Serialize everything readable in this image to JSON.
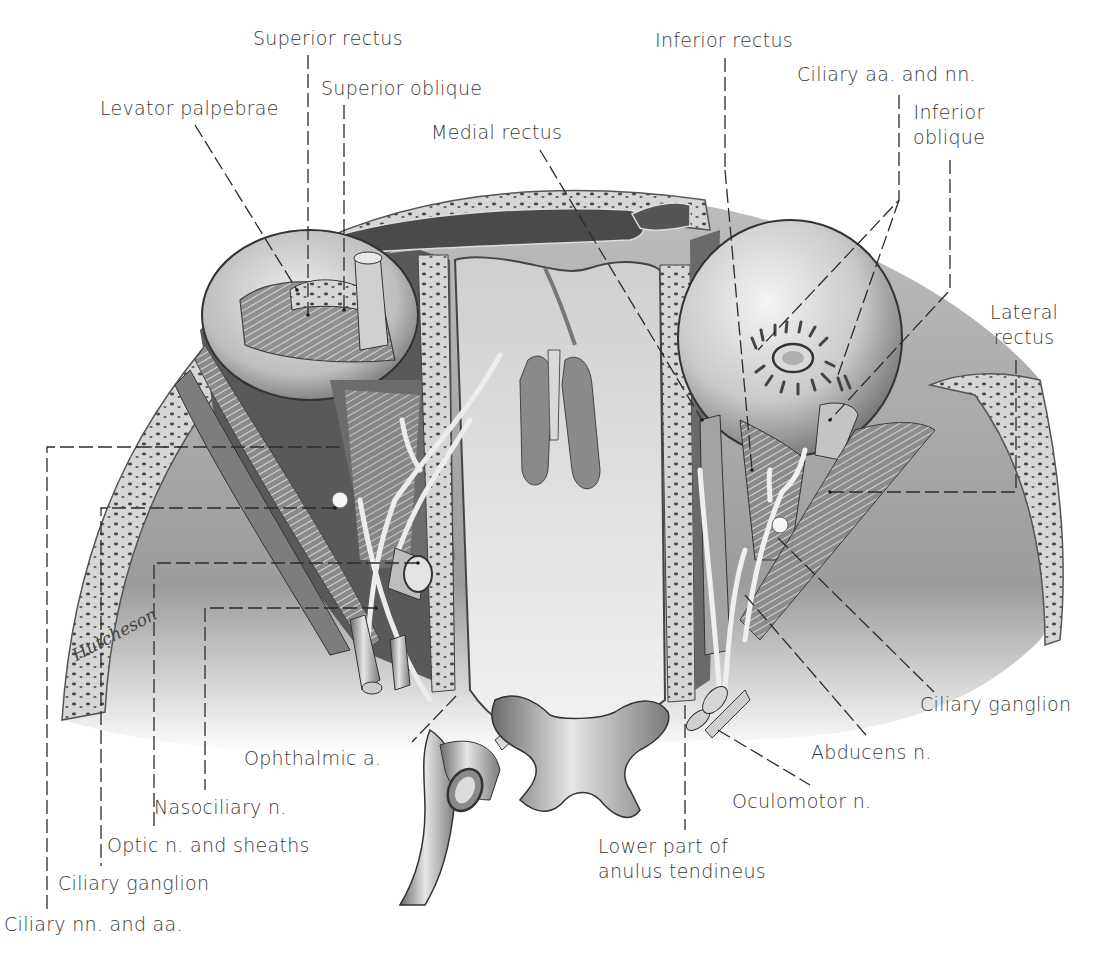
{
  "figure": {
    "signature": "Hutcheson",
    "colors": {
      "background": "#ffffff",
      "label_text": "#3a3a3a",
      "leader_line": "#2b2b2b",
      "bone_light": "#d9d9d9",
      "bone_dark": "#5a5a5a",
      "tissue_mid": "#9a9a9a",
      "tissue_dark": "#3c3c3c"
    }
  },
  "labels": {
    "superior_rectus": "Superior rectus",
    "superior_oblique": "Superior oblique",
    "levator_palpebrae": "Levator palpebrae",
    "medial_rectus": "Medial rectus",
    "inferior_rectus": "Inferior rectus",
    "ciliary_aa_nn": "Ciliary aa. and nn.",
    "inferior_oblique_1": "Inferior",
    "inferior_oblique_2": "oblique",
    "lateral_rectus_1": "Lateral",
    "lateral_rectus_2": "rectus",
    "ciliary_ganglion_right": "Ciliary ganglion",
    "abducens_n": "Abducens n.",
    "oculomotor_n": "Oculomotor n.",
    "anulus_1": "Lower part of",
    "anulus_2": "anulus tendineus",
    "ophthalmic_a": "Ophthalmic a.",
    "nasociliary_n": "Nasociliary n.",
    "optic_n": "Optic n. and sheaths",
    "ciliary_ganglion_left": "Ciliary ganglion",
    "ciliary_nn_aa": "Ciliary nn. and aa."
  }
}
